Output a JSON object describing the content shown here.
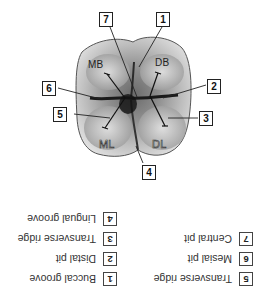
{
  "figure": {
    "callouts": [
      {
        "num": "7"
      },
      {
        "num": "1"
      },
      {
        "num": "2"
      },
      {
        "num": "6"
      },
      {
        "num": "5"
      },
      {
        "num": "3"
      },
      {
        "num": "4"
      }
    ],
    "regions": {
      "mb": "MB",
      "db": "DB",
      "ml": "ML",
      "dl": "DL"
    }
  },
  "answer_key": {
    "orientation": "rotated 180°",
    "items": [
      {
        "num": "1",
        "label": "Buccal groove"
      },
      {
        "num": "2",
        "label": "Distal pit"
      },
      {
        "num": "3",
        "label": "Transverse ridge"
      },
      {
        "num": "4",
        "label": "Lingual groove"
      },
      {
        "num": "5",
        "label": "Transverse ridge"
      },
      {
        "num": "6",
        "label": "Mesial pit"
      },
      {
        "num": "7",
        "label": "Central pit"
      }
    ]
  }
}
